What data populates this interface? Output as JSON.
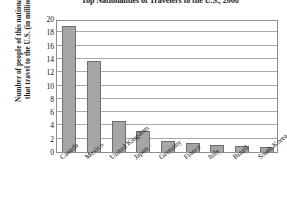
{
  "chart_data": {
    "type": "bar",
    "title": "Top Nationalities of Travelers to the U.S., 2008",
    "xlabel": "",
    "ylabel": "Number of people of this nationality that travel to the U.S. (in millions)",
    "ylabel_line1": "Number of people of this nationality",
    "ylabel_line2": "that travel to the U.S. (in millions)",
    "categories": [
      "Canada",
      "Mexico",
      "United Kingdom",
      "Japan",
      "Germany",
      "France",
      "Italy",
      "Brazil",
      "South Korea"
    ],
    "values": [
      18.9,
      13.7,
      4.6,
      3.2,
      1.7,
      1.3,
      1.1,
      0.9,
      0.7
    ],
    "ylim": [
      0,
      20
    ],
    "ytick_step": 2,
    "yticks": [
      0,
      2,
      4,
      6,
      8,
      10,
      12,
      14,
      16,
      18,
      20
    ],
    "ytick_labels": [
      "0",
      "2",
      "4",
      "6",
      "8",
      "10",
      "12",
      "14",
      "16",
      "18",
      "20"
    ],
    "grid": true,
    "grid_axis": "y",
    "legend": false,
    "bar_color": "#a6a6a6",
    "bar_edge_color": "#6f6f6f",
    "axis_color": "#8d8d8d",
    "gridline_color": "#a9a9a9",
    "background_color": "#ffffff"
  }
}
